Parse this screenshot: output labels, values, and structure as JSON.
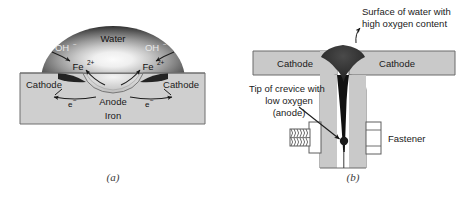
{
  "figure": {
    "title_a_caption": "(a)",
    "title_b_caption": "(b)"
  },
  "panel_a": {
    "name": "water-droplet-corrosion-cell",
    "droplet_label": "Water",
    "hydroxide_left": "OH",
    "hydroxide_left_sup": "−",
    "hydroxide_right": "OH",
    "hydroxide_right_sup": "−",
    "iron_ion_left": "Fe",
    "iron_ion_left_sup": "2+",
    "iron_ion_right": "Fe",
    "iron_ion_right_sup": "2+",
    "cathode_left": "Cathode",
    "cathode_right": "Cathode",
    "anode": "Anode",
    "metal": "Iron",
    "electron_left": "e",
    "electron_left_sup": "−",
    "electron_right": "e",
    "electron_right_sup": "−",
    "caption": "(a)"
  },
  "panel_b": {
    "name": "crevice-corrosion-fastener",
    "surface_note_line1": "Surface of water with",
    "surface_note_line2": "high oxygen content",
    "crevice_note_line1": "Tip of crevice with",
    "crevice_note_line2": "low oxygen",
    "crevice_note_line3": "(anode)",
    "cathode_left": "Cathode",
    "cathode_right": "Cathode",
    "fastener": "Fastener",
    "caption": "(b)"
  },
  "colors": {
    "metal_fill": "#c9c9c9",
    "metal_stroke": "#6b6b6b",
    "water_dark": "#2b2b2b",
    "water_mid": "#8a8a8a",
    "water_light": "#f2f2f2",
    "ink": "#1a1a1a",
    "caption": "#3a3a3a",
    "page_bg": "#ffffff"
  }
}
